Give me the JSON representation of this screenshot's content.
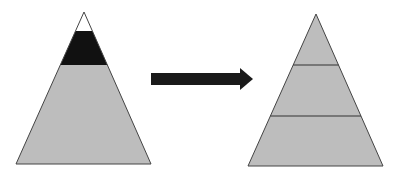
{
  "diagram": {
    "colors": {
      "background": "#ffffff",
      "gray_fill": "#bdbdbd",
      "black_band": "#111111",
      "tip_fill": "#ffffff",
      "outline": "#444444",
      "arrow": "#1a1a1a"
    },
    "left_pyramid": {
      "apex": [
        84,
        12
      ],
      "base_left": [
        16,
        164
      ],
      "base_right": [
        151,
        164
      ],
      "bands": [
        {
          "name": "tip",
          "color": "white",
          "y_top": 12,
          "y_bottom": 31
        },
        {
          "name": "middle",
          "color": "black",
          "y_top": 31,
          "y_bottom": 65
        },
        {
          "name": "base",
          "color": "gray",
          "y_top": 65,
          "y_bottom": 164
        }
      ]
    },
    "arrow": {
      "direction": "right",
      "from": [
        151,
        79
      ],
      "to": [
        253,
        79
      ]
    },
    "right_pyramid": {
      "apex": [
        316,
        14
      ],
      "base_left": [
        248,
        166
      ],
      "base_right": [
        383,
        166
      ],
      "divider_lines_y": [
        65,
        116
      ],
      "tiers": 3
    }
  }
}
